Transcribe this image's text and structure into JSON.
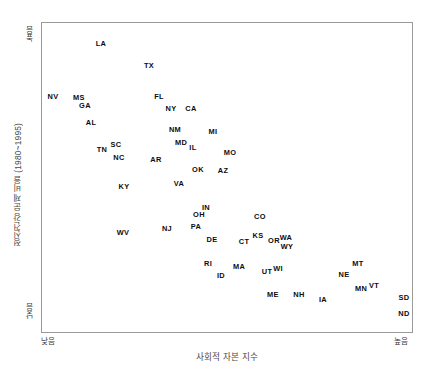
{
  "chart_data": {
    "type": "scatter",
    "title": "",
    "xlabel": "사회적 자본 지수",
    "ylabel": "정신건강 문제 비율 (1980~1995)",
    "x_tick_labels": [
      "낮음",
      "높음"
    ],
    "y_tick_labels": [
      "높음",
      "낮음"
    ],
    "xlim": [
      0,
      100
    ],
    "ylim": [
      0,
      100
    ],
    "grid": false,
    "legend": null,
    "point_label_key": "state",
    "points": [
      {
        "state": "LA",
        "px": 100,
        "py": 43
      },
      {
        "state": "TX",
        "px": 148,
        "py": 65
      },
      {
        "state": "NV",
        "px": 52,
        "py": 96
      },
      {
        "state": "MS",
        "px": 78,
        "py": 97
      },
      {
        "state": "GA",
        "px": 84,
        "py": 105
      },
      {
        "state": "FL",
        "px": 158,
        "py": 96
      },
      {
        "state": "NY",
        "px": 170,
        "py": 108
      },
      {
        "state": "CA",
        "px": 190,
        "py": 108
      },
      {
        "state": "AL",
        "px": 90,
        "py": 122
      },
      {
        "state": "NM",
        "px": 174,
        "py": 129
      },
      {
        "state": "MI",
        "px": 212,
        "py": 131
      },
      {
        "state": "MD",
        "px": 180,
        "py": 142
      },
      {
        "state": "IL",
        "px": 192,
        "py": 147
      },
      {
        "state": "TN",
        "px": 101,
        "py": 149
      },
      {
        "state": "SC",
        "px": 115,
        "py": 144
      },
      {
        "state": "NC",
        "px": 118,
        "py": 157
      },
      {
        "state": "AR",
        "px": 155,
        "py": 159
      },
      {
        "state": "MO",
        "px": 229,
        "py": 152
      },
      {
        "state": "OK",
        "px": 197,
        "py": 169
      },
      {
        "state": "AZ",
        "px": 222,
        "py": 170
      },
      {
        "state": "KY",
        "px": 123,
        "py": 186
      },
      {
        "state": "VA",
        "px": 178,
        "py": 183
      },
      {
        "state": "IN",
        "px": 205,
        "py": 207
      },
      {
        "state": "OH",
        "px": 198,
        "py": 214
      },
      {
        "state": "CO",
        "px": 259,
        "py": 216
      },
      {
        "state": "PA",
        "px": 195,
        "py": 226
      },
      {
        "state": "NJ",
        "px": 166,
        "py": 228
      },
      {
        "state": "WV",
        "px": 122,
        "py": 232
      },
      {
        "state": "KS",
        "px": 257,
        "py": 235
      },
      {
        "state": "CT",
        "px": 243,
        "py": 241
      },
      {
        "state": "WA",
        "px": 285,
        "py": 237
      },
      {
        "state": "OR",
        "px": 273,
        "py": 240
      },
      {
        "state": "WY",
        "px": 286,
        "py": 246
      },
      {
        "state": "DE",
        "px": 211,
        "py": 239
      },
      {
        "state": "RI",
        "px": 207,
        "py": 263
      },
      {
        "state": "MA",
        "px": 238,
        "py": 266
      },
      {
        "state": "MT",
        "px": 357,
        "py": 263
      },
      {
        "state": "ID",
        "px": 220,
        "py": 275
      },
      {
        "state": "UT",
        "px": 266,
        "py": 271
      },
      {
        "state": "WI",
        "px": 277,
        "py": 268
      },
      {
        "state": "NE",
        "px": 343,
        "py": 274
      },
      {
        "state": "VT",
        "px": 373,
        "py": 285
      },
      {
        "state": "MN",
        "px": 360,
        "py": 288
      },
      {
        "state": "ME",
        "px": 272,
        "py": 294
      },
      {
        "state": "NH",
        "px": 298,
        "py": 294
      },
      {
        "state": "IA",
        "px": 322,
        "py": 299
      },
      {
        "state": "SD",
        "px": 403,
        "py": 297
      },
      {
        "state": "ND",
        "px": 403,
        "py": 313
      }
    ]
  },
  "axes": {
    "y_top_label": "높음",
    "y_bottom_label": "낮음",
    "x_left_label": "낮음",
    "x_right_label": "높음",
    "y_title": "정신건강 문제 비율 (1980~1995)",
    "x_title": "사회적 자본 지수"
  },
  "colors": {
    "background": "#ffffff",
    "frame": "#9a9a9a",
    "label_text": "#0d0d0d",
    "axis_text": "#4a4a4a"
  }
}
